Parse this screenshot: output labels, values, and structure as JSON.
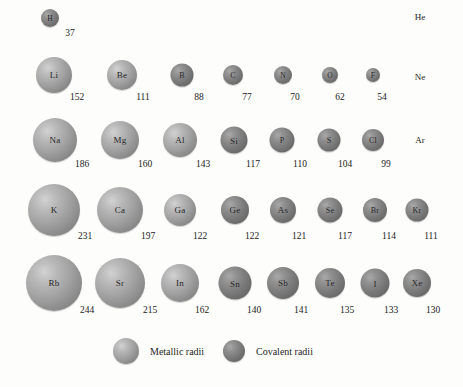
{
  "chart_data": {
    "type": "scatter",
    "title": "",
    "xlabel": "",
    "ylabel": "",
    "units": "pm",
    "legend": [
      {
        "key": "metallic",
        "label": "Metallic radii",
        "color": "#a2a2a2"
      },
      {
        "key": "covalent",
        "label": "Covalent radii",
        "color": "#7d7d7d"
      }
    ],
    "legend_position": "bottom-center",
    "grid": false,
    "rows": [
      {
        "period": 1,
        "y": 18,
        "value_y": 28,
        "elements": [
          {
            "symbol": "H",
            "value": 37,
            "kind": "covalent",
            "x": 50,
            "d": 18,
            "value_x": 70
          }
        ],
        "text_labels": [
          {
            "symbol": "He",
            "x": 420,
            "y": 17
          }
        ]
      },
      {
        "period": 2,
        "y": 75,
        "value_y": 92,
        "elements": [
          {
            "symbol": "Li",
            "value": 152,
            "kind": "metallic",
            "x": 54,
            "d": 36,
            "value_x": 77
          },
          {
            "symbol": "Be",
            "value": 111,
            "kind": "metallic",
            "x": 122,
            "d": 30,
            "value_x": 143
          },
          {
            "symbol": "B",
            "value": 88,
            "kind": "covalent",
            "x": 182,
            "d": 23,
            "value_x": 199
          },
          {
            "symbol": "C",
            "value": 77,
            "kind": "covalent",
            "x": 233,
            "d": 20,
            "value_x": 247
          },
          {
            "symbol": "N",
            "value": 70,
            "kind": "covalent",
            "x": 283,
            "d": 18,
            "value_x": 295
          },
          {
            "symbol": "O",
            "value": 62,
            "kind": "covalent",
            "x": 330,
            "d": 16,
            "value_x": 340
          },
          {
            "symbol": "F",
            "value": 54,
            "kind": "covalent",
            "x": 373,
            "d": 14,
            "value_x": 382
          }
        ],
        "text_labels": [
          {
            "symbol": "Ne",
            "x": 420,
            "y": 77
          }
        ]
      },
      {
        "period": 3,
        "y": 140,
        "value_y": 159,
        "elements": [
          {
            "symbol": "Na",
            "value": 186,
            "kind": "metallic",
            "x": 55,
            "d": 44,
            "value_x": 82
          },
          {
            "symbol": "Mg",
            "value": 160,
            "kind": "metallic",
            "x": 120,
            "d": 38,
            "value_x": 145
          },
          {
            "symbol": "Al",
            "value": 143,
            "kind": "metallic",
            "x": 180,
            "d": 34,
            "value_x": 203
          },
          {
            "symbol": "Si",
            "value": 117,
            "kind": "covalent",
            "x": 234,
            "d": 27,
            "value_x": 253
          },
          {
            "symbol": "P",
            "value": 110,
            "kind": "covalent",
            "x": 282,
            "d": 25,
            "value_x": 300
          },
          {
            "symbol": "S",
            "value": 104,
            "kind": "covalent",
            "x": 329,
            "d": 23,
            "value_x": 345
          },
          {
            "symbol": "Cl",
            "value": 99,
            "kind": "covalent",
            "x": 373,
            "d": 22,
            "value_x": 386
          }
        ],
        "text_labels": [
          {
            "symbol": "Ar",
            "x": 420,
            "y": 140
          }
        ]
      },
      {
        "period": 4,
        "y": 210,
        "value_y": 231,
        "elements": [
          {
            "symbol": "K",
            "value": 231,
            "kind": "metallic",
            "x": 54,
            "d": 52,
            "value_x": 85
          },
          {
            "symbol": "Ca",
            "value": 197,
            "kind": "metallic",
            "x": 120,
            "d": 46,
            "value_x": 148
          },
          {
            "symbol": "Ga",
            "value": 122,
            "kind": "metallic",
            "x": 180,
            "d": 32,
            "value_x": 200
          },
          {
            "symbol": "Ge",
            "value": 122,
            "kind": "covalent",
            "x": 235,
            "d": 28,
            "value_x": 252
          },
          {
            "symbol": "As",
            "value": 121,
            "kind": "covalent",
            "x": 283,
            "d": 26,
            "value_x": 299
          },
          {
            "symbol": "Se",
            "value": 117,
            "kind": "covalent",
            "x": 330,
            "d": 25,
            "value_x": 345
          },
          {
            "symbol": "Br",
            "value": 114,
            "kind": "covalent",
            "x": 375,
            "d": 24,
            "value_x": 389
          },
          {
            "symbol": "Kr",
            "value": 111,
            "kind": "covalent",
            "x": 417,
            "d": 23,
            "value_x": 431
          }
        ],
        "text_labels": []
      },
      {
        "period": 5,
        "y": 283,
        "value_y": 305,
        "elements": [
          {
            "symbol": "Rb",
            "value": 244,
            "kind": "metallic",
            "x": 54,
            "d": 56,
            "value_x": 87
          },
          {
            "symbol": "Sr",
            "value": 215,
            "kind": "metallic",
            "x": 120,
            "d": 50,
            "value_x": 150
          },
          {
            "symbol": "In",
            "value": 162,
            "kind": "metallic",
            "x": 180,
            "d": 38,
            "value_x": 202
          },
          {
            "symbol": "Sn",
            "value": 140,
            "kind": "covalent",
            "x": 235,
            "d": 33,
            "value_x": 254
          },
          {
            "symbol": "Sb",
            "value": 141,
            "kind": "covalent",
            "x": 283,
            "d": 32,
            "value_x": 301
          },
          {
            "symbol": "Te",
            "value": 135,
            "kind": "covalent",
            "x": 330,
            "d": 30,
            "value_x": 347
          },
          {
            "symbol": "I",
            "value": 133,
            "kind": "covalent",
            "x": 375,
            "d": 29,
            "value_x": 391
          },
          {
            "symbol": "Xe",
            "value": 130,
            "kind": "covalent",
            "x": 417,
            "d": 28,
            "value_x": 433
          }
        ],
        "text_labels": []
      }
    ]
  }
}
